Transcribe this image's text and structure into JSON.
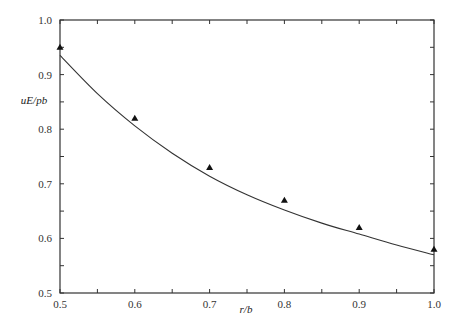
{
  "chart_data": {
    "type": "line",
    "title": "",
    "xlabel": "r/b",
    "ylabel": "uE/pb",
    "xlim": [
      0.5,
      1.0
    ],
    "ylim": [
      0.5,
      1.0
    ],
    "grid": false,
    "legend": null,
    "x_ticks": [
      "0.5",
      "0.6",
      "0.7",
      "0.8",
      "0.9",
      "1.0"
    ],
    "y_ticks": [
      "0.5",
      "0.6",
      "0.7",
      "0.8",
      "0.9",
      "1.0"
    ],
    "x_minor_step": 0.05,
    "y_minor_step": 0.05,
    "series": [
      {
        "name": "theory",
        "style": "line",
        "x": [
          0.5,
          0.55,
          0.6,
          0.65,
          0.7,
          0.75,
          0.8,
          0.85,
          0.9,
          0.95,
          1.0
        ],
        "values": [
          0.935,
          0.865,
          0.806,
          0.756,
          0.714,
          0.68,
          0.652,
          0.628,
          0.608,
          0.588,
          0.57
        ]
      },
      {
        "name": "measured",
        "style": "triangle-markers",
        "x": [
          0.5,
          0.6,
          0.7,
          0.8,
          0.9,
          1.0
        ],
        "values": [
          0.95,
          0.82,
          0.73,
          0.67,
          0.62,
          0.58
        ]
      }
    ]
  },
  "colors": {
    "axis": "#333333",
    "line": "#333333",
    "marker": "#111111"
  }
}
